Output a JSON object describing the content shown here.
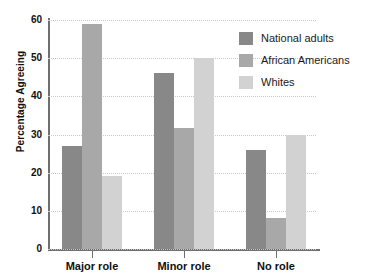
{
  "chart_data": {
    "type": "bar",
    "title": "",
    "subtitle": "",
    "xlabel": "",
    "ylabel": "Percentage Agreeing",
    "ylim": [
      0,
      60
    ],
    "yticks": [
      0,
      10,
      20,
      30,
      40,
      50,
      60
    ],
    "ytick_labels": [
      "0",
      "10",
      "20",
      "30",
      "40",
      "50",
      "60"
    ],
    "grid": true,
    "grid_axis": "y",
    "grid_style": "dotted",
    "legend_position": "top-right",
    "categories": [
      "Major role",
      "Minor role",
      "No role"
    ],
    "series": [
      {
        "name": "National adults",
        "color": "#888888",
        "values": [
          27,
          46,
          26
        ]
      },
      {
        "name": "African Americans",
        "color": "#a8a8a8",
        "values": [
          59,
          31.7,
          8
        ]
      },
      {
        "name": "Whites",
        "color": "#d2d2d2",
        "values": [
          19,
          50,
          30
        ]
      }
    ]
  },
  "legend": {
    "items": [
      {
        "label": "National adults",
        "color": "#888888"
      },
      {
        "label": "African Americans",
        "color": "#a8a8a8"
      },
      {
        "label": "Whites",
        "color": "#d2d2d2"
      }
    ]
  },
  "axes": {
    "y_title": "Percentage Agreeing",
    "axis_color": "#6f6f6f",
    "grid_color": "#c8c8c8"
  }
}
